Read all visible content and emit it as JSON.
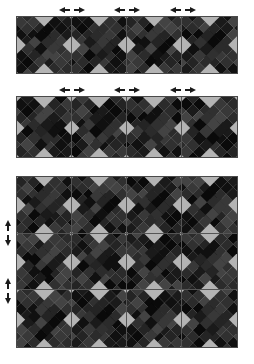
{
  "figure": {
    "background_color": "#ffffff",
    "width": 254,
    "height": 364
  },
  "palette": {
    "block_background": "#b4b4b4",
    "seam_line": "#555555",
    "panel_border": "#4a4a4a",
    "arrow_color": "#1b1b1b",
    "patch_shades": [
      "#2b2b2b",
      "#1a1a1a",
      "#383838",
      "#101010",
      "#242424",
      "#303030",
      "#0a0a0a",
      "#434343"
    ]
  },
  "motif": {
    "name": "saltire-patchwork-x",
    "description": "Two crossing diagonal patchwork bands forming an X, leaving four light gray corner triangles",
    "band_columns": 8,
    "band_rows": 3,
    "band_angles_deg": [
      45,
      -45
    ]
  },
  "panels": [
    {
      "id": "panel-top",
      "label": "Top strip",
      "columns": 4,
      "rows": 1,
      "x": 16,
      "y": 16,
      "width": 222,
      "height": 58,
      "arrows": {
        "top": [
          {
            "label": "seam-marker-1",
            "at_column_seam": 1
          },
          {
            "label": "seam-marker-2",
            "at_column_seam": 2
          },
          {
            "label": "seam-marker-3",
            "at_column_seam": 3
          }
        ],
        "left": []
      }
    },
    {
      "id": "panel-middle",
      "label": "Middle strip",
      "columns": 4,
      "rows": 1,
      "x": 16,
      "y": 96,
      "width": 222,
      "height": 62,
      "arrows": {
        "top": [
          {
            "label": "seam-marker-1",
            "at_column_seam": 1
          },
          {
            "label": "seam-marker-2",
            "at_column_seam": 2
          },
          {
            "label": "seam-marker-3",
            "at_column_seam": 3
          }
        ],
        "left": []
      }
    },
    {
      "id": "panel-bottom",
      "label": "Full assembly",
      "columns": 4,
      "rows": 3,
      "x": 16,
      "y": 176,
      "width": 222,
      "height": 172,
      "arrows": {
        "top": [],
        "left": [
          {
            "label": "row-seam-marker-1",
            "at_row_seam": 1
          },
          {
            "label": "row-seam-marker-2",
            "at_row_seam": 2
          }
        ]
      }
    }
  ],
  "band_patch_map": [
    [
      0,
      1,
      2,
      3,
      1,
      0,
      4,
      5
    ],
    [
      1,
      3,
      0,
      6,
      2,
      1,
      3,
      0
    ],
    [
      4,
      0,
      5,
      1,
      3,
      2,
      0,
      1
    ]
  ]
}
